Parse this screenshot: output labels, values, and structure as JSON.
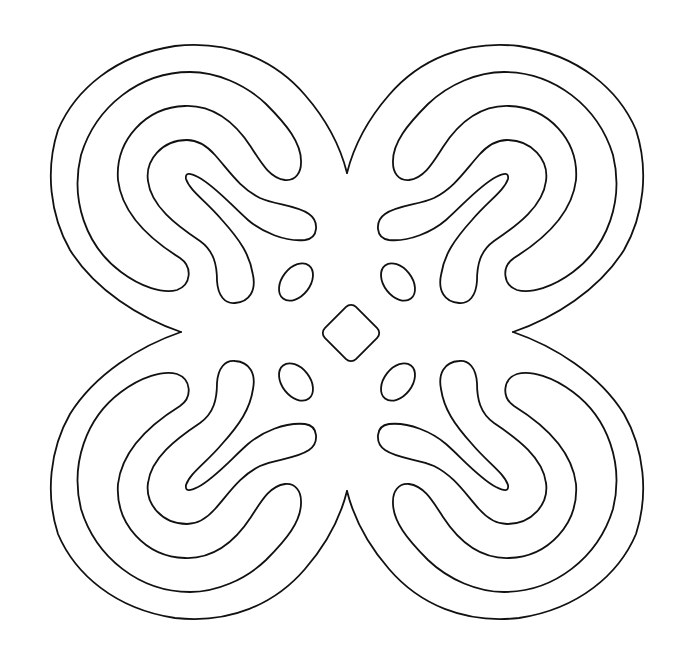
{
  "image": {
    "title": "Adinkra-style line-art symbol",
    "description": "Four-lobed symmetric outline with concentric curved bands, four small ellipses and a central rounded diamond",
    "stroke_color": "#111111",
    "background_color": "#ffffff"
  },
  "figure": {
    "center": [
      347,
      333
    ],
    "lobes": [
      "top-left",
      "top-right",
      "bottom-left",
      "bottom-right"
    ],
    "ellipse_count": 4,
    "center_shape": "rounded-diamond"
  }
}
